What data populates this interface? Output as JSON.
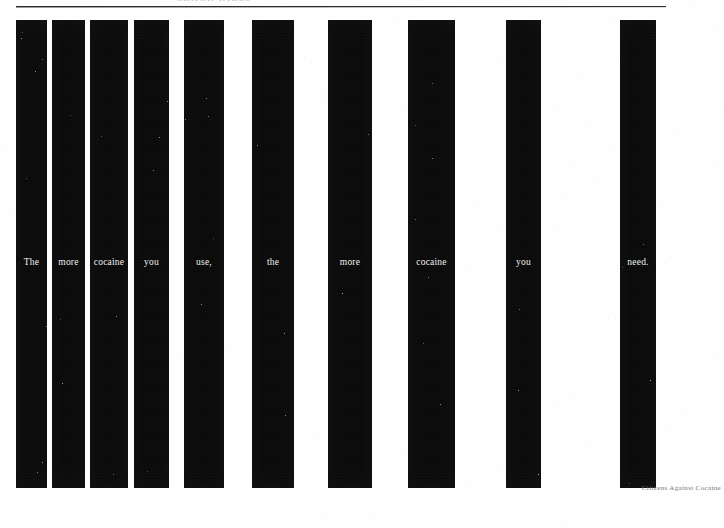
{
  "page": {
    "width": 724,
    "height": 528,
    "background_color": "#fefefe",
    "ink_color": "#0b0b0b",
    "word_color": "#f4f4f4"
  },
  "header": {
    "text": "CRACK KILLS",
    "clipped": true
  },
  "headline": {
    "full_sentence": "The more cocaine you use, the more cocaine you need."
  },
  "bars": [
    {
      "word": "The",
      "x": 16,
      "width": 31
    },
    {
      "word": "more",
      "x": 52,
      "width": 33
    },
    {
      "word": "cocaine",
      "x": 90,
      "width": 38
    },
    {
      "word": "you",
      "x": 134,
      "width": 35
    },
    {
      "word": "use,",
      "x": 184,
      "width": 40
    },
    {
      "word": "the",
      "x": 252,
      "width": 42
    },
    {
      "word": "more",
      "x": 328,
      "width": 44
    },
    {
      "word": "cocaine",
      "x": 408,
      "width": 47
    },
    {
      "word": "you",
      "x": 506,
      "width": 35
    },
    {
      "word": "need.",
      "x": 620,
      "width": 36
    }
  ],
  "credit": {
    "text": "Citizens Against Cocaine"
  },
  "rule": {
    "x": 16,
    "y": 6,
    "width": 650
  }
}
